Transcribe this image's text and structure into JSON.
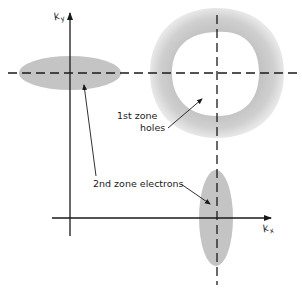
{
  "diagram": {
    "type": "fermi-surface-zone-scheme",
    "axes": {
      "x_label_base": "k",
      "x_label_sub": "x",
      "y_label_base": "k",
      "y_label_sub": "y"
    },
    "labels": {
      "first_zone_line1": "1st zone",
      "first_zone_line2": "holes",
      "second_zone": "2nd zone electrons"
    },
    "colors": {
      "fill": "#c8c8c8",
      "ring_outer": "#cfcfcf",
      "line": "#1a1a1a",
      "background": "#ffffff"
    }
  }
}
